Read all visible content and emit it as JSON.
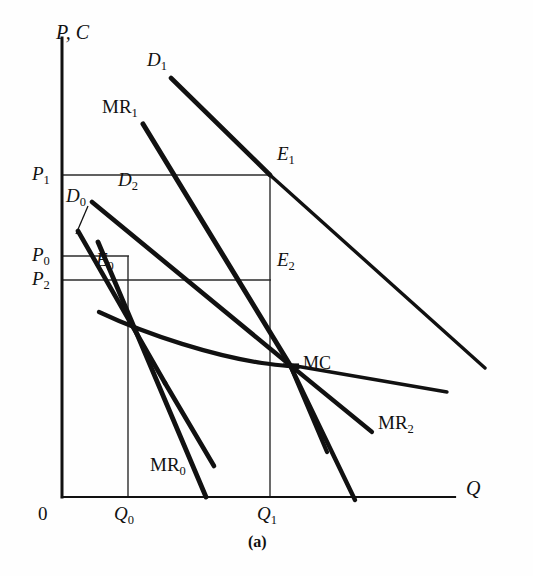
{
  "figure": {
    "caption": "(a)",
    "axes": {
      "y_axis_label_base": "P",
      "y_axis_label_full": "P, C",
      "x_axis_label": "Q",
      "origin_label": "0"
    },
    "price_ticks": [
      {
        "id": "P1",
        "base": "P",
        "sub": "1",
        "y_px": 175
      },
      {
        "id": "P0",
        "base": "P",
        "sub": "0",
        "y_px": 256
      },
      {
        "id": "P2",
        "base": "P",
        "sub": "2",
        "y_px": 280
      }
    ],
    "quantity_ticks": [
      {
        "id": "Q0",
        "base": "Q",
        "sub": "0",
        "x_px": 128
      },
      {
        "id": "Q1",
        "base": "Q",
        "sub": "1",
        "x_px": 270
      }
    ],
    "demand_curves": [
      {
        "id": "D0",
        "base": "D",
        "sub": "0",
        "label_x": 66,
        "label_y": 196
      },
      {
        "id": "D1",
        "base": "D",
        "sub": "1",
        "label_x": 148,
        "label_y": 58
      },
      {
        "id": "D2",
        "base": "D",
        "sub": "2",
        "label_x": 118,
        "label_y": 178
      }
    ],
    "marginal_revenue_curves": [
      {
        "id": "MR0",
        "base": "MR",
        "sub": "0",
        "label_x": 150,
        "label_y": 461
      },
      {
        "id": "MR1",
        "base": "MR",
        "sub": "1",
        "label_x": 103,
        "label_y": 100
      },
      {
        "id": "MR2",
        "base": "MR",
        "sub": "2",
        "label_x": 380,
        "label_y": 420
      }
    ],
    "cost_curve": {
      "id": "MC",
      "label": "MC",
      "label_x": 302,
      "label_y": 353
    },
    "equilibrium_points": [
      {
        "id": "E0",
        "base": "E",
        "sub": "0",
        "label_x": 98,
        "label_y": 256,
        "x_px": 128,
        "y_px": 256
      },
      {
        "id": "E1",
        "base": "E",
        "sub": "1",
        "label_x": 276,
        "label_y": 152,
        "x_px": 270,
        "y_px": 175
      },
      {
        "id": "E2",
        "base": "E",
        "sub": "2",
        "label_x": 276,
        "label_y": 258,
        "x_px": 270,
        "y_px": 280
      }
    ],
    "colors": {
      "ink": "#111111",
      "thin_rule": "#333333",
      "background": "#ffffff"
    },
    "geometry": {
      "y_axis_x": 62,
      "x_axis_y": 497,
      "y_axis_top": 38,
      "x_axis_right": 455
    }
  }
}
